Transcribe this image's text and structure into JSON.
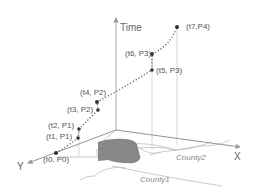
{
  "diagram": {
    "type": "space-time trajectory",
    "axes": {
      "time": "Time",
      "x": "X",
      "y": "Y"
    },
    "points": [
      {
        "label": "(t0, P0)",
        "x": 56,
        "y": 153
      },
      {
        "label": "(t1, P1)",
        "x": 78,
        "y": 138
      },
      {
        "label": "(t2, P1)",
        "x": 79,
        "y": 129
      },
      {
        "label": "(t3, P2)",
        "x": 98,
        "y": 110
      },
      {
        "label": "(t4, P2)",
        "x": 97,
        "y": 102
      },
      {
        "label": "(t5, P3)",
        "x": 152,
        "y": 70
      },
      {
        "label": "(t6, P3)",
        "x": 152,
        "y": 54
      },
      {
        "label": "(t7,P4)",
        "x": 177,
        "y": 27
      }
    ],
    "regions": [
      "County2",
      "County1"
    ],
    "colors": {
      "axis": "#9a9a9a",
      "trajectory": "#555555",
      "point": "#333333",
      "region_fill": "#7a7a7a",
      "boundary": "#b5b5b5"
    }
  }
}
